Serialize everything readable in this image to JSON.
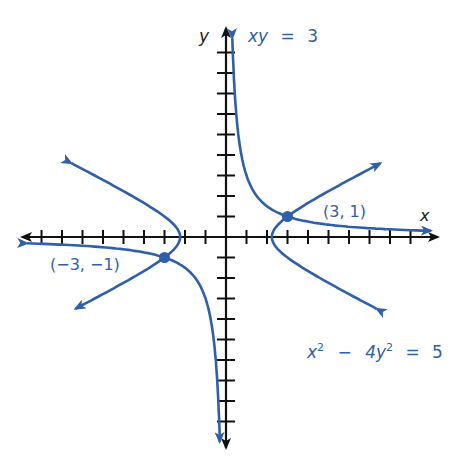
{
  "figure": {
    "axes": {
      "x_label": "x",
      "y_label": "y",
      "origin_px": [
        226,
        237
      ],
      "unit_px": 20.5,
      "x_ticks": [
        -9,
        -8,
        -7,
        -6,
        -5,
        -4,
        -3,
        -2,
        -1,
        1,
        2,
        3,
        4,
        5,
        6,
        7,
        8,
        9
      ],
      "y_ticks": [
        -9,
        -8,
        -7,
        -6,
        -5,
        -4,
        -3,
        -2,
        -1,
        1,
        2,
        3,
        4,
        5,
        6,
        7,
        8,
        9
      ]
    },
    "curves": [
      {
        "name": "xy = 3",
        "label_var1": "xy",
        "label_eq": "=",
        "label_rhs": "3"
      },
      {
        "name": "x^2 - 4y^2 = 5",
        "label_x": "x",
        "label_x_exp": "2",
        "label_minus": "−",
        "label_coef": "4y",
        "label_y_exp": "2",
        "label_eq": "=",
        "label_rhs": "5"
      }
    ],
    "points": [
      {
        "label": "(3, 1)",
        "x": 3,
        "y": 1
      },
      {
        "label": "(−3, −1)",
        "x": -3,
        "y": -1
      }
    ],
    "colors": {
      "curve": "#2f5fa8",
      "axis": "#111111",
      "text": "#2f5fa8"
    }
  }
}
